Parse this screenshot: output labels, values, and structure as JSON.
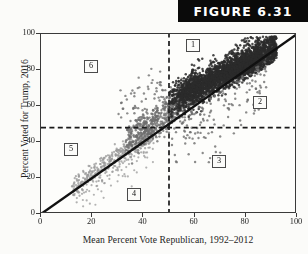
{
  "figure": {
    "banner_label": "FIGURE 6.31"
  },
  "axes": {
    "x_title": "Mean Percent Vote Republican, 1992–2012",
    "y_title": "Percent Voted for Trump, 2016",
    "x_ticks": [
      "0",
      "20",
      "40",
      "60",
      "80",
      "100"
    ],
    "y_ticks": [
      "0",
      "20",
      "40",
      "60",
      "80",
      "100"
    ]
  },
  "regions": [
    {
      "label": "1",
      "x_px": 186,
      "y_px": 39
    },
    {
      "label": "2",
      "x_px": 253,
      "y_px": 96
    },
    {
      "label": "3",
      "x_px": 212,
      "y_px": 155
    },
    {
      "label": "4",
      "x_px": 127,
      "y_px": 188
    },
    {
      "label": "5",
      "x_px": 64,
      "y_px": 143
    },
    {
      "label": "6",
      "x_px": 84,
      "y_px": 60
    }
  ],
  "colors": {
    "frame": "#3a3a3a",
    "banner_bg": "#0a0a0a",
    "banner_text": "#ffffff",
    "point_dark": "#2b2b2b",
    "point_mid": "#6e6e6e",
    "point_light": "#9a9a9a",
    "diagonal_line": "#111111",
    "dashed_line": "#1a1a1a",
    "background": "#fbfbf9"
  },
  "chart_data": {
    "type": "scatter",
    "title": "FIGURE 6.31",
    "xlabel": "Mean Percent Vote Republican, 1992–2012",
    "ylabel": "Percent Voted for Trump, 2016",
    "xlim": [
      0,
      100
    ],
    "ylim": [
      0,
      100
    ],
    "xticks": [
      0,
      20,
      40,
      60,
      80,
      100
    ],
    "yticks": [
      0,
      20,
      40,
      60,
      80,
      100
    ],
    "grid": false,
    "legend": null,
    "reference_lines": [
      {
        "kind": "identity",
        "style": "solid",
        "from": [
          0,
          0
        ],
        "to": [
          100,
          100
        ],
        "label": "y = x"
      },
      {
        "kind": "vertical",
        "style": "dashed",
        "value": 50
      },
      {
        "kind": "horizontal",
        "style": "dashed",
        "value": 48
      }
    ],
    "annotations": [
      {
        "text": "1",
        "x": 57,
        "y": 92,
        "note": "above identity, right of x=50, above y=48"
      },
      {
        "text": "2",
        "x": 83,
        "y": 63,
        "note": "below identity, right of x=50, above y=48"
      },
      {
        "text": "3",
        "x": 67,
        "y": 26,
        "note": "right of x=50, below y=48"
      },
      {
        "text": "4",
        "x": 34,
        "y": 14,
        "note": "left of x=50, below y=48, below identity"
      },
      {
        "text": "5",
        "x": 10,
        "y": 38,
        "note": "left of x=50, below y=48, above identity"
      },
      {
        "text": "6",
        "x": 18,
        "y": 85,
        "note": "left of x=50, above y=48"
      }
    ],
    "n_points": 3100,
    "clusters": [
      {
        "name": "dense-upper-right",
        "x_range": [
          50,
          92
        ],
        "y_range": [
          58,
          96
        ],
        "count": 1750,
        "shade": "dark"
      },
      {
        "name": "mid-band",
        "x_range": [
          35,
          62
        ],
        "y_range": [
          42,
          80
        ],
        "count": 700,
        "shade": "mid"
      },
      {
        "name": "sparse-lower-left",
        "x_range": [
          12,
          45
        ],
        "y_range": [
          8,
          48
        ],
        "count": 520,
        "shade": "light"
      },
      {
        "name": "below-identity-right",
        "x_range": [
          55,
          88
        ],
        "y_range": [
          40,
          70
        ],
        "count": 110,
        "shade": "mid"
      },
      {
        "name": "region-3-outliers",
        "x_range": [
          52,
          70
        ],
        "y_range": [
          28,
          46
        ],
        "count": 20,
        "shade": "mid"
      }
    ]
  }
}
